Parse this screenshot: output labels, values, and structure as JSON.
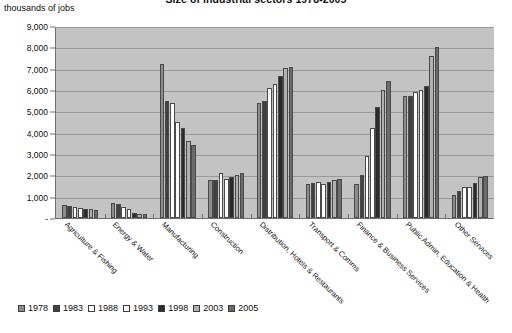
{
  "chart_data": {
    "type": "bar",
    "title": "Size of industrial sectors 1978-2005",
    "ylabel": "thousands of jobs",
    "xlabel": "",
    "ylim": [
      0,
      9000
    ],
    "ytick_labels": [
      "9,000",
      "8,000",
      "7,000",
      "6,000",
      "5,000",
      "4,000",
      "3,000",
      "2,000",
      "1,000",
      "-"
    ],
    "ytick_values": [
      9000,
      8000,
      7000,
      6000,
      5000,
      4000,
      3000,
      2000,
      1000,
      0
    ],
    "grid": true,
    "legend_position": "bottom",
    "categories": [
      "Agriculture & Fishing",
      "Energy & Water",
      "Manufacturing",
      "Construction",
      "Distribution, Hotels & Restaurants",
      "Transport & Comms",
      "Finance & Business Services",
      "Public Admin, Education & Health",
      "Other Services"
    ],
    "series": [
      {
        "name": "1978",
        "color": "#8c8c8c",
        "values": [
          620,
          700,
          7200,
          1800,
          5400,
          1600,
          1600,
          5700,
          1100
        ]
      },
      {
        "name": "1983",
        "color": "#404040",
        "values": [
          560,
          640,
          5500,
          1800,
          5500,
          1650,
          2000,
          5700,
          1250
        ]
      },
      {
        "name": "1988",
        "color": "#ffffff",
        "values": [
          520,
          520,
          5400,
          2100,
          6100,
          1700,
          2900,
          5900,
          1450
        ]
      },
      {
        "name": "1993",
        "color": "#fafafa",
        "values": [
          480,
          400,
          4500,
          1850,
          6300,
          1600,
          4200,
          6000,
          1450
        ]
      },
      {
        "name": "1998",
        "color": "#2b2b2b",
        "values": [
          430,
          240,
          4200,
          1900,
          6650,
          1700,
          5200,
          6200,
          1650
        ]
      },
      {
        "name": "2003",
        "color": "#b0b0b0",
        "values": [
          400,
          200,
          3600,
          2000,
          7050,
          1800,
          6000,
          7600,
          1900
        ]
      },
      {
        "name": "2005",
        "color": "#6b6b6b",
        "values": [
          380,
          190,
          3400,
          2100,
          7100,
          1850,
          6400,
          8000,
          1950
        ]
      }
    ]
  }
}
